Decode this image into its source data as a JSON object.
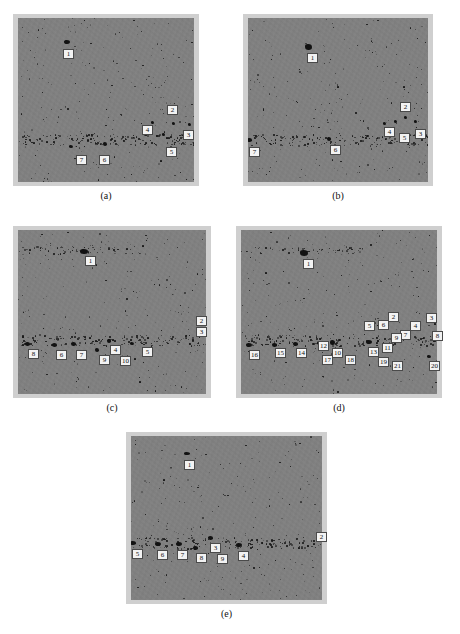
{
  "figure": {
    "kind": "multi-panel-image-figure",
    "background_color": "#ffffff",
    "panel_border_color": "#cfcfcf",
    "panel_background_color": "#818181",
    "label_box_fill": "#f2f2f2",
    "label_box_border": "#4a4a4a",
    "label_text_color": "#111111",
    "panel_count": 5,
    "panels": [
      {
        "id": "panel-a",
        "caption": "(a)",
        "frame": {
          "x": 13,
          "y": 14,
          "w": 186,
          "h": 172
        },
        "caption_y": 190,
        "label_count": 7,
        "labels": [
          {
            "text": "1",
            "x": 63,
            "y": 49
          },
          {
            "text": "2",
            "x": 167,
            "y": 105
          },
          {
            "text": "3",
            "x": 183,
            "y": 130
          },
          {
            "text": "4",
            "x": 142,
            "y": 125
          },
          {
            "text": "5",
            "x": 166,
            "y": 147
          },
          {
            "text": "6",
            "x": 99,
            "y": 155
          },
          {
            "text": "7",
            "x": 76,
            "y": 155
          }
        ],
        "blobs": [
          {
            "x": 64,
            "y": 40,
            "w": 6,
            "h": 4
          },
          {
            "x": 103,
            "y": 142,
            "w": 4,
            "h": 4
          },
          {
            "x": 162,
            "y": 133,
            "w": 3,
            "h": 3
          },
          {
            "x": 151,
            "y": 121,
            "w": 3,
            "h": 3
          },
          {
            "x": 172,
            "y": 122,
            "w": 3,
            "h": 3
          },
          {
            "x": 188,
            "y": 123,
            "w": 3,
            "h": 3
          },
          {
            "x": 69,
            "y": 145,
            "w": 4,
            "h": 3
          }
        ]
      },
      {
        "id": "panel-b",
        "caption": "(b)",
        "frame": {
          "x": 243,
          "y": 14,
          "w": 190,
          "h": 172
        },
        "caption_y": 190,
        "label_count": 7,
        "labels": [
          {
            "text": "1",
            "x": 307,
            "y": 53
          },
          {
            "text": "2",
            "x": 400,
            "y": 102
          },
          {
            "text": "3",
            "x": 415,
            "y": 129
          },
          {
            "text": "4",
            "x": 384,
            "y": 127
          },
          {
            "text": "5",
            "x": 399,
            "y": 133
          },
          {
            "text": "6",
            "x": 330,
            "y": 145
          },
          {
            "text": "7",
            "x": 249,
            "y": 147
          }
        ],
        "blobs": [
          {
            "x": 305,
            "y": 44,
            "w": 7,
            "h": 6
          },
          {
            "x": 327,
            "y": 137,
            "w": 4,
            "h": 4
          },
          {
            "x": 247,
            "y": 138,
            "w": 5,
            "h": 4
          },
          {
            "x": 394,
            "y": 120,
            "w": 3,
            "h": 3
          },
          {
            "x": 404,
            "y": 116,
            "w": 3,
            "h": 3
          },
          {
            "x": 414,
            "y": 120,
            "w": 3,
            "h": 3
          },
          {
            "x": 383,
            "y": 122,
            "w": 3,
            "h": 3
          }
        ]
      },
      {
        "id": "panel-c",
        "caption": "(c)",
        "frame": {
          "x": 13,
          "y": 226,
          "w": 198,
          "h": 172
        },
        "caption_y": 402,
        "label_count": 10,
        "labels": [
          {
            "text": "1",
            "x": 85,
            "y": 256
          },
          {
            "text": "2",
            "x": 196,
            "y": 316
          },
          {
            "text": "3",
            "x": 196,
            "y": 327
          },
          {
            "text": "4",
            "x": 110,
            "y": 345
          },
          {
            "text": "5",
            "x": 142,
            "y": 347
          },
          {
            "text": "6",
            "x": 56,
            "y": 350
          },
          {
            "text": "7",
            "x": 76,
            "y": 350
          },
          {
            "text": "8",
            "x": 28,
            "y": 349
          },
          {
            "text": "9",
            "x": 99,
            "y": 355
          },
          {
            "text": "10",
            "x": 120,
            "y": 356
          }
        ],
        "blobs": [
          {
            "x": 80,
            "y": 249,
            "w": 8,
            "h": 5
          },
          {
            "x": 25,
            "y": 342,
            "w": 5,
            "h": 4
          },
          {
            "x": 52,
            "y": 343,
            "w": 5,
            "h": 4
          },
          {
            "x": 71,
            "y": 342,
            "w": 5,
            "h": 4
          },
          {
            "x": 95,
            "y": 348,
            "w": 4,
            "h": 4
          },
          {
            "x": 107,
            "y": 339,
            "w": 4,
            "h": 4
          },
          {
            "x": 130,
            "y": 342,
            "w": 4,
            "h": 3
          }
        ]
      },
      {
        "id": "panel-d",
        "caption": "(d)",
        "frame": {
          "x": 236,
          "y": 226,
          "w": 206,
          "h": 172
        },
        "caption_y": 402,
        "label_count": 21,
        "labels": [
          {
            "text": "1",
            "x": 303,
            "y": 259
          },
          {
            "text": "2",
            "x": 388,
            "y": 312
          },
          {
            "text": "3",
            "x": 426,
            "y": 313
          },
          {
            "text": "4",
            "x": 410,
            "y": 321
          },
          {
            "text": "5",
            "x": 364,
            "y": 321
          },
          {
            "text": "6",
            "x": 378,
            "y": 320
          },
          {
            "text": "7",
            "x": 400,
            "y": 330
          },
          {
            "text": "8",
            "x": 432,
            "y": 331
          },
          {
            "text": "9",
            "x": 391,
            "y": 333
          },
          {
            "text": "10",
            "x": 332,
            "y": 348
          },
          {
            "text": "11",
            "x": 382,
            "y": 343
          },
          {
            "text": "12",
            "x": 318,
            "y": 341
          },
          {
            "text": "13",
            "x": 368,
            "y": 347
          },
          {
            "text": "14",
            "x": 296,
            "y": 348
          },
          {
            "text": "15",
            "x": 275,
            "y": 348
          },
          {
            "text": "16",
            "x": 249,
            "y": 350
          },
          {
            "text": "17",
            "x": 322,
            "y": 355
          },
          {
            "text": "18",
            "x": 345,
            "y": 355
          },
          {
            "text": "19",
            "x": 378,
            "y": 357
          },
          {
            "text": "20",
            "x": 429,
            "y": 361
          },
          {
            "text": "21",
            "x": 392,
            "y": 361
          }
        ],
        "blobs": [
          {
            "x": 300,
            "y": 250,
            "w": 8,
            "h": 6
          },
          {
            "x": 246,
            "y": 343,
            "w": 6,
            "h": 4
          },
          {
            "x": 272,
            "y": 343,
            "w": 5,
            "h": 4
          },
          {
            "x": 293,
            "y": 342,
            "w": 5,
            "h": 4
          },
          {
            "x": 317,
            "y": 341,
            "w": 6,
            "h": 4
          },
          {
            "x": 330,
            "y": 340,
            "w": 5,
            "h": 5
          },
          {
            "x": 366,
            "y": 340,
            "w": 6,
            "h": 4
          },
          {
            "x": 428,
            "y": 318,
            "w": 4,
            "h": 4
          },
          {
            "x": 427,
            "y": 355,
            "w": 4,
            "h": 3
          }
        ]
      },
      {
        "id": "panel-e",
        "caption": "(e)",
        "frame": {
          "x": 126,
          "y": 432,
          "w": 201,
          "h": 172
        },
        "caption_y": 608,
        "label_count": 9,
        "labels": [
          {
            "text": "1",
            "x": 184,
            "y": 460
          },
          {
            "text": "2",
            "x": 316,
            "y": 532
          },
          {
            "text": "3",
            "x": 210,
            "y": 543
          },
          {
            "text": "4",
            "x": 238,
            "y": 551
          },
          {
            "text": "5",
            "x": 132,
            "y": 549
          },
          {
            "text": "6",
            "x": 157,
            "y": 550
          },
          {
            "text": "7",
            "x": 177,
            "y": 550
          },
          {
            "text": "8",
            "x": 196,
            "y": 553
          },
          {
            "text": "9",
            "x": 217,
            "y": 554
          }
        ],
        "blobs": [
          {
            "x": 184,
            "y": 452,
            "w": 6,
            "h": 3
          },
          {
            "x": 130,
            "y": 541,
            "w": 6,
            "h": 4
          },
          {
            "x": 155,
            "y": 542,
            "w": 6,
            "h": 4
          },
          {
            "x": 176,
            "y": 542,
            "w": 6,
            "h": 4
          },
          {
            "x": 193,
            "y": 546,
            "w": 5,
            "h": 4
          },
          {
            "x": 208,
            "y": 536,
            "w": 5,
            "h": 4
          },
          {
            "x": 236,
            "y": 543,
            "w": 6,
            "h": 4
          }
        ]
      }
    ]
  }
}
